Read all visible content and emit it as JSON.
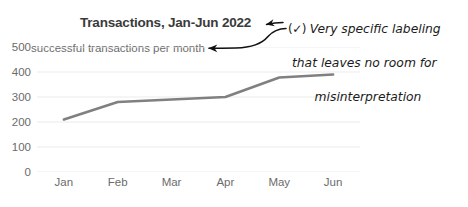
{
  "chart_data": {
    "type": "line",
    "title": "Transactions, Jan-Jun 2022",
    "subtitle": "successful transactions per month",
    "xlabel": "",
    "ylabel": "successful transactions per month",
    "categories": [
      "Jan",
      "Feb",
      "Mar",
      "Apr",
      "May",
      "Jun"
    ],
    "values": [
      210,
      280,
      290,
      300,
      378,
      390
    ],
    "series": [
      {
        "name": "successful transactions per month",
        "values": [
          210,
          280,
          290,
          300,
          378,
          390
        ]
      }
    ],
    "ylim": [
      0,
      500
    ],
    "yticks": [
      500,
      400,
      300,
      200,
      100,
      0
    ],
    "ytick_labels": [
      "500",
      "400",
      "300",
      "200",
      "100",
      "0"
    ],
    "xtick_labels": [
      "Jan",
      "Feb",
      "Mar",
      "Apr",
      "May",
      "Jun"
    ],
    "grid": true,
    "grid_axis": "y",
    "legend": false,
    "legend_position": "none",
    "line_color": "#808080",
    "grid_color": "#ebebeb",
    "text_color": "#6b6b6b",
    "title_color": "#3a3a3a"
  },
  "annotation": {
    "check_symbol": "(✓)",
    "line1": "Very specific labeling",
    "line2": "that leaves no room for",
    "line3": "misinterpretation",
    "full_text": "(✓) Very specific labeling that leaves no room for misinterpretation",
    "color": "#1b1b1b",
    "arrow_count": 2,
    "arrow_targets": [
      "chart-title",
      "chart-subtitle"
    ]
  }
}
